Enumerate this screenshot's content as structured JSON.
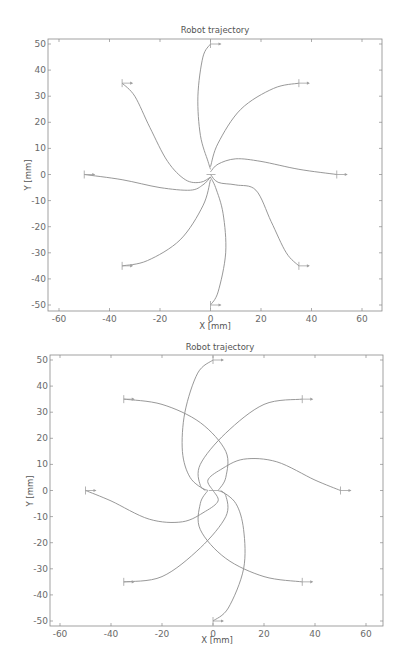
{
  "figure": {
    "caption": ""
  },
  "chart_data": [
    {
      "type": "line",
      "title": "Robot trajectory",
      "xlabel": "X [mm]",
      "ylabel": "Y [mm]",
      "xlim": [
        -65,
        67
      ],
      "ylim": [
        -52,
        52
      ],
      "xticks": [
        -60,
        -40,
        -20,
        0,
        20,
        40,
        60
      ],
      "yticks": [
        -50,
        -40,
        -30,
        -20,
        -10,
        0,
        10,
        20,
        30,
        40,
        50
      ],
      "grid": false,
      "legend": null,
      "start_markers": [
        [
          0,
          50
        ],
        [
          35,
          35
        ],
        [
          50,
          0
        ],
        [
          35,
          -35
        ],
        [
          0,
          -50
        ],
        [
          -35,
          -35
        ],
        [
          -50,
          0
        ],
        [
          -35,
          35
        ]
      ],
      "series": [
        {
          "name": "from (0,50)",
          "points": [
            [
              0,
              50
            ],
            [
              -3,
              45
            ],
            [
              -5,
              30
            ],
            [
              -4,
              15
            ],
            [
              -1,
              5
            ],
            [
              0,
              2
            ]
          ]
        },
        {
          "name": "from (35,35)",
          "points": [
            [
              35,
              35
            ],
            [
              25,
              33
            ],
            [
              12,
              25
            ],
            [
              3,
              12
            ],
            [
              0,
              3
            ]
          ]
        },
        {
          "name": "from (50,0)",
          "points": [
            [
              50,
              0
            ],
            [
              35,
              2
            ],
            [
              20,
              5
            ],
            [
              10,
              6
            ],
            [
              3,
              4
            ],
            [
              0,
              1
            ]
          ]
        },
        {
          "name": "from (35,-35)",
          "points": [
            [
              35,
              -35
            ],
            [
              30,
              -30
            ],
            [
              24,
              -18
            ],
            [
              18,
              -6
            ],
            [
              10,
              -4
            ],
            [
              3,
              -3
            ],
            [
              0,
              0
            ]
          ]
        },
        {
          "name": "from (0,-50)",
          "points": [
            [
              0,
              -50
            ],
            [
              3,
              -45
            ],
            [
              6,
              -30
            ],
            [
              5,
              -15
            ],
            [
              2,
              -5
            ],
            [
              0,
              -1
            ]
          ]
        },
        {
          "name": "from (-35,-35)",
          "points": [
            [
              -35,
              -35
            ],
            [
              -25,
              -33
            ],
            [
              -12,
              -25
            ],
            [
              -3,
              -12
            ],
            [
              0,
              -2
            ]
          ]
        },
        {
          "name": "from (-50,0)",
          "points": [
            [
              -50,
              0
            ],
            [
              -35,
              -2
            ],
            [
              -20,
              -5
            ],
            [
              -8,
              -6
            ],
            [
              -3,
              -4
            ],
            [
              0,
              -1
            ]
          ]
        },
        {
          "name": "from (-35,35)",
          "points": [
            [
              -35,
              35
            ],
            [
              -30,
              30
            ],
            [
              -24,
              18
            ],
            [
              -17,
              5
            ],
            [
              -10,
              -2
            ],
            [
              -4,
              -3
            ],
            [
              0,
              -1
            ]
          ]
        }
      ]
    },
    {
      "type": "line",
      "title": "Robot trajectory",
      "xlabel": "X [mm]",
      "ylabel": "Y [mm]",
      "xlim": [
        -65,
        67
      ],
      "ylim": [
        -52,
        52
      ],
      "xticks": [
        -60,
        -40,
        -20,
        0,
        20,
        40,
        60
      ],
      "yticks": [
        -50,
        -40,
        -30,
        -20,
        -10,
        0,
        10,
        20,
        30,
        40,
        50
      ],
      "grid": false,
      "legend": null,
      "start_markers": [
        [
          0,
          50
        ],
        [
          35,
          35
        ],
        [
          50,
          0
        ],
        [
          35,
          -35
        ],
        [
          0,
          -50
        ],
        [
          -35,
          -35
        ],
        [
          -50,
          0
        ],
        [
          -35,
          35
        ]
      ],
      "series": [
        {
          "name": "from (0,50)",
          "points": [
            [
              0,
              50
            ],
            [
              -6,
              45
            ],
            [
              -11,
              30
            ],
            [
              -12,
              15
            ],
            [
              -9,
              5
            ],
            [
              -3,
              0
            ]
          ]
        },
        {
          "name": "from (35,35)",
          "points": [
            [
              35,
              35
            ],
            [
              20,
              33
            ],
            [
              5,
              22
            ],
            [
              -5,
              10
            ],
            [
              -5,
              2
            ],
            [
              -2,
              0
            ]
          ]
        },
        {
          "name": "from (50,0)",
          "points": [
            [
              50,
              0
            ],
            [
              40,
              4
            ],
            [
              25,
              11
            ],
            [
              12,
              12
            ],
            [
              3,
              8
            ],
            [
              -2,
              4
            ],
            [
              0,
              0
            ]
          ]
        },
        {
          "name": "from (35,-35)",
          "points": [
            [
              35,
              -35
            ],
            [
              20,
              -33
            ],
            [
              5,
              -26
            ],
            [
              -5,
              -15
            ],
            [
              -5,
              -5
            ],
            [
              -2,
              0
            ]
          ]
        },
        {
          "name": "from (0,-50)",
          "points": [
            [
              0,
              -50
            ],
            [
              6,
              -45
            ],
            [
              12,
              -30
            ],
            [
              12,
              -15
            ],
            [
              9,
              -5
            ],
            [
              3,
              0
            ]
          ]
        },
        {
          "name": "from (-35,-35)",
          "points": [
            [
              -35,
              -35
            ],
            [
              -20,
              -33
            ],
            [
              -5,
              -22
            ],
            [
              5,
              -10
            ],
            [
              5,
              -2
            ],
            [
              2,
              0
            ]
          ]
        },
        {
          "name": "from (-50,0)",
          "points": [
            [
              -50,
              0
            ],
            [
              -40,
              -4
            ],
            [
              -25,
              -11
            ],
            [
              -12,
              -12
            ],
            [
              -3,
              -8
            ],
            [
              2,
              -4
            ],
            [
              0,
              0
            ]
          ]
        },
        {
          "name": "from (-35,35)",
          "points": [
            [
              -35,
              35
            ],
            [
              -20,
              33
            ],
            [
              -5,
              26
            ],
            [
              5,
              15
            ],
            [
              5,
              5
            ],
            [
              2,
              0
            ]
          ]
        }
      ]
    }
  ],
  "plots": [
    {
      "title": "Robot trajectory",
      "xlabel": "X [mm]",
      "ylabel": "Y [mm]"
    },
    {
      "title": "Robot trajectory",
      "xlabel": "X [mm]",
      "ylabel": "Y [mm]"
    }
  ]
}
